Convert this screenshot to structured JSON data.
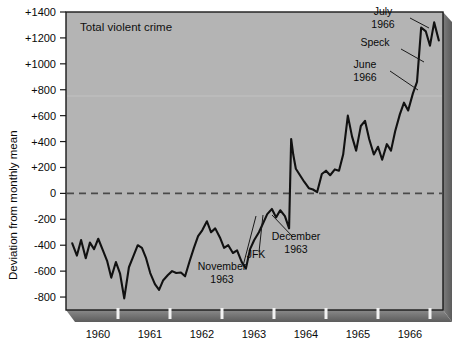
{
  "figure": {
    "background_color": "#ffffff",
    "plot_background_color": "#b4b4b4",
    "plot_border_color": "#1a1a1a",
    "shadow_color": "#6e6e6e",
    "line_color": "#111111",
    "zero_line_color": "#4a4a4a"
  },
  "chart_data": {
    "type": "line",
    "title": "Total violent crime",
    "xlabel": "",
    "ylabel": "Deviation from monthly mean",
    "ylim": [
      -900,
      1400
    ],
    "xlim": [
      1959.5,
      1966.75
    ],
    "grid": false,
    "legend": null,
    "yticks": [
      {
        "value": 1400,
        "label": "+1400"
      },
      {
        "value": 1200,
        "label": "+1200"
      },
      {
        "value": 1000,
        "label": "+1000"
      },
      {
        "value": 800,
        "label": "+800"
      },
      {
        "value": 600,
        "label": "+600"
      },
      {
        "value": 400,
        "label": "+400"
      },
      {
        "value": 200,
        "label": "+200"
      },
      {
        "value": 0,
        "label": "0"
      },
      {
        "value": -200,
        "label": "-200"
      },
      {
        "value": -400,
        "label": "-400"
      },
      {
        "value": -600,
        "label": "-600"
      },
      {
        "value": -800,
        "label": "-800"
      }
    ],
    "xticks": [
      {
        "value": 1960,
        "label": "1960"
      },
      {
        "value": 1961,
        "label": "1961"
      },
      {
        "value": 1962,
        "label": "1962"
      },
      {
        "value": 1963,
        "label": "1963"
      },
      {
        "value": 1964,
        "label": "1964"
      },
      {
        "value": 1965,
        "label": "1965"
      },
      {
        "value": 1966,
        "label": "1966"
      }
    ],
    "reference_line": {
      "value": 0,
      "style": "dashed"
    },
    "series": [
      {
        "name": "Total violent crime",
        "x": [
          1959.62,
          1959.71,
          1959.79,
          1959.88,
          1959.96,
          1960.04,
          1960.12,
          1960.21,
          1960.29,
          1960.37,
          1960.46,
          1960.54,
          1960.62,
          1960.71,
          1960.79,
          1960.88,
          1960.96,
          1961.04,
          1961.12,
          1961.21,
          1961.29,
          1961.37,
          1961.46,
          1961.54,
          1961.62,
          1961.71,
          1961.79,
          1961.88,
          1961.96,
          1962.04,
          1962.12,
          1962.21,
          1962.29,
          1962.37,
          1962.46,
          1962.54,
          1962.62,
          1962.71,
          1962.79,
          1962.88,
          1962.96,
          1963.04,
          1963.12,
          1963.21,
          1963.29,
          1963.37,
          1963.46,
          1963.54,
          1963.62,
          1963.71,
          1963.79,
          1963.83,
          1963.87,
          1963.92,
          1964.0,
          1964.08,
          1964.17,
          1964.25,
          1964.33,
          1964.42,
          1964.5,
          1964.58,
          1964.67,
          1964.75,
          1964.83,
          1964.92,
          1965.0,
          1965.08,
          1965.17,
          1965.25,
          1965.33,
          1965.42,
          1965.5,
          1965.58,
          1965.67,
          1965.75,
          1965.83,
          1965.92,
          1966.0,
          1966.08,
          1966.17,
          1966.25,
          1966.33,
          1966.42,
          1966.5,
          1966.58,
          1966.67
        ],
        "values": [
          -385,
          -480,
          -360,
          -500,
          -380,
          -430,
          -350,
          -440,
          -520,
          -650,
          -530,
          -620,
          -810,
          -570,
          -490,
          -400,
          -420,
          -500,
          -615,
          -700,
          -745,
          -670,
          -630,
          -600,
          -615,
          -610,
          -640,
          -520,
          -420,
          -330,
          -285,
          -215,
          -300,
          -270,
          -340,
          -420,
          -400,
          -460,
          -440,
          -530,
          -580,
          -430,
          -360,
          -300,
          -230,
          -160,
          -120,
          -185,
          -130,
          -175,
          -270,
          420,
          300,
          190,
          140,
          90,
          40,
          30,
          10,
          150,
          175,
          140,
          185,
          175,
          300,
          600,
          440,
          330,
          520,
          560,
          420,
          300,
          360,
          260,
          380,
          330,
          480,
          610,
          700,
          640,
          770,
          860,
          1280,
          1250,
          1140,
          1320,
          1180
        ]
      }
    ],
    "annotations": [
      {
        "id": "july-1966",
        "lines": [
          "July",
          "1966"
        ],
        "x_px": 383,
        "y_px": 15
      },
      {
        "id": "speck",
        "lines": [
          "Speck"
        ],
        "x_px": 375,
        "y_px": 46
      },
      {
        "id": "june-1966",
        "lines": [
          "June",
          "1966"
        ],
        "x_px": 365,
        "y_px": 68
      },
      {
        "id": "december-1963",
        "lines": [
          "December",
          "1963"
        ],
        "x_px": 296,
        "y_px": 240
      },
      {
        "id": "jfk",
        "lines": [
          "JFK"
        ],
        "x_px": 256,
        "y_px": 258
      },
      {
        "id": "november-1963",
        "lines": [
          "November",
          "1963"
        ],
        "x_px": 222,
        "y_px": 270
      }
    ]
  }
}
